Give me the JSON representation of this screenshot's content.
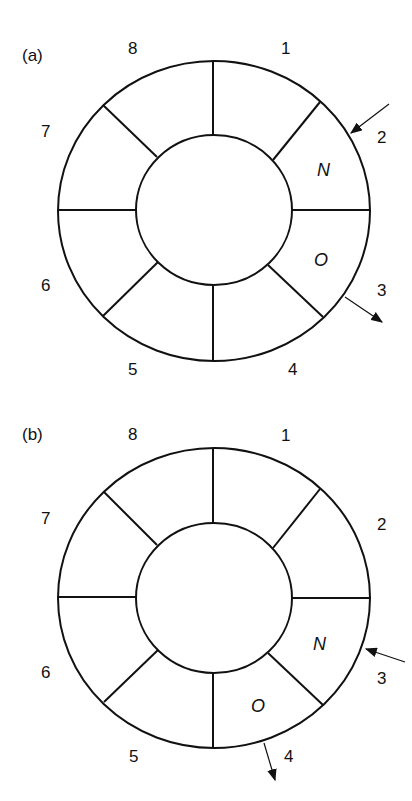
{
  "panels": [
    {
      "label": "(a)",
      "sectors": [
        "1",
        "2",
        "3",
        "4",
        "5",
        "6",
        "7",
        "8"
      ],
      "marked": {
        "N": "N",
        "O": "O"
      },
      "description": "N in sector 2, O in sector 3; input arrow at sector 2, output arrow at sector 3"
    },
    {
      "label": "(b)",
      "sectors": [
        "1",
        "2",
        "3",
        "4",
        "5",
        "6",
        "7",
        "8"
      ],
      "marked": {
        "N": "N",
        "O": "O"
      },
      "description": "N in sector 3, O in sector 4; input arrow at sector 3, output arrow at sector 4"
    }
  ],
  "colors": {
    "line": "#111111",
    "background": "#ffffff"
  }
}
